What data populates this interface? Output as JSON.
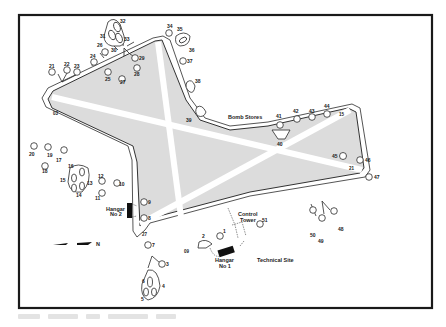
{
  "map": {
    "title": "Airfield layout plan",
    "colors": {
      "airfield_fill": "#dcdcdc",
      "runway": "#ffffff",
      "ink": "#222222",
      "frame": "#1a1a1a"
    },
    "site_labels": {
      "bomb_stores": "Bomb Stores",
      "technical_site": "Technical Site",
      "control_tower_line1": "Control",
      "control_tower_line2": "Tower",
      "hangar1_line1": "Hangar",
      "hangar1_line2": "No 1",
      "hangar2_line1": "Hangar",
      "hangar2_line2": "No 2"
    },
    "north_arrow": {
      "label": "N",
      "icon": "north-arrow-icon"
    },
    "runway_ends": [
      "03",
      "21",
      "15",
      "33",
      "27",
      "09"
    ],
    "runway_end_labels": {
      "r03": "03",
      "r21": "21",
      "r15": "15",
      "r27": "27",
      "r09": "09"
    },
    "dispersals": [
      {
        "id": "1",
        "label": "1"
      },
      {
        "id": "2",
        "label": "2"
      },
      {
        "id": "3",
        "label": "3"
      },
      {
        "id": "4",
        "label": "4"
      },
      {
        "id": "5",
        "label": "5"
      },
      {
        "id": "6",
        "label": "6"
      },
      {
        "id": "7",
        "label": "7"
      },
      {
        "id": "8",
        "label": "8"
      },
      {
        "id": "9",
        "label": "9"
      },
      {
        "id": "10",
        "label": "10"
      },
      {
        "id": "11",
        "label": "11"
      },
      {
        "id": "12",
        "label": "12"
      },
      {
        "id": "13",
        "label": "13"
      },
      {
        "id": "14",
        "label": "14"
      },
      {
        "id": "15",
        "label": "15"
      },
      {
        "id": "16",
        "label": "16"
      },
      {
        "id": "17",
        "label": "17"
      },
      {
        "id": "18",
        "label": "18"
      },
      {
        "id": "19",
        "label": "19"
      },
      {
        "id": "20",
        "label": "20"
      },
      {
        "id": "21",
        "label": "21"
      },
      {
        "id": "22",
        "label": "22"
      },
      {
        "id": "23",
        "label": "23"
      },
      {
        "id": "24",
        "label": "24"
      },
      {
        "id": "25",
        "label": "25"
      },
      {
        "id": "26",
        "label": "26"
      },
      {
        "id": "27",
        "label": "27"
      },
      {
        "id": "28",
        "label": "28"
      },
      {
        "id": "29",
        "label": "29"
      },
      {
        "id": "30",
        "label": "30"
      },
      {
        "id": "31",
        "label": "31"
      },
      {
        "id": "32",
        "label": "32"
      },
      {
        "id": "33",
        "label": "33"
      },
      {
        "id": "34",
        "label": "34"
      },
      {
        "id": "35",
        "label": "35"
      },
      {
        "id": "36",
        "label": "36"
      },
      {
        "id": "37",
        "label": "37"
      },
      {
        "id": "38",
        "label": "38"
      },
      {
        "id": "39",
        "label": "39"
      },
      {
        "id": "40",
        "label": "40"
      },
      {
        "id": "41",
        "label": "41"
      },
      {
        "id": "42",
        "label": "42"
      },
      {
        "id": "43",
        "label": "43"
      },
      {
        "id": "44",
        "label": "44"
      },
      {
        "id": "45",
        "label": "45"
      },
      {
        "id": "46",
        "label": "46"
      },
      {
        "id": "47",
        "label": "47"
      },
      {
        "id": "48",
        "label": "48"
      },
      {
        "id": "49",
        "label": "49"
      },
      {
        "id": "50",
        "label": "50"
      },
      {
        "id": "51",
        "label": "51"
      }
    ]
  }
}
